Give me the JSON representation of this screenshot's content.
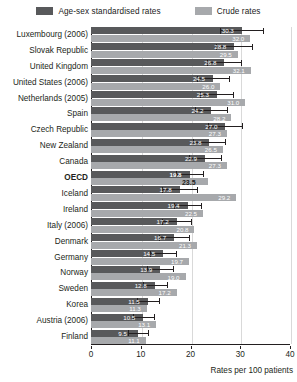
{
  "legend": {
    "items": [
      {
        "label": "Age-sex standardised rates",
        "color": "#58595b",
        "key": "standardised"
      },
      {
        "label": "Crude rates",
        "color": "#a7a9ac",
        "key": "crude"
      }
    ]
  },
  "axis": {
    "title": "Rates per 100 patients",
    "ticks": [
      "0",
      "10",
      "20",
      "30",
      "40"
    ],
    "min": 0,
    "max": 40
  },
  "colors": {
    "standardised": "#58595b",
    "crude": "#a7a9ac",
    "axis": "#231f20",
    "grid": "#d9d9d9"
  },
  "chart_data": {
    "type": "bar",
    "title": "",
    "subtitle": "",
    "xlabel": "Rates per 100 patients",
    "ylabel": "",
    "xlim": [
      0,
      40
    ],
    "grid": true,
    "orientation": "horizontal",
    "legend_position": "top",
    "categories": [
      "Luxembourg (2006)",
      "Slovak Republic",
      "United Kingdom",
      "United States (2006)",
      "Netherlands (2005)",
      "Spain",
      "Czech Republic",
      "New Zealand",
      "Canada",
      "OECD",
      "Iceland",
      "Ireland",
      "Italy (2006)",
      "Denmark",
      "Germany",
      "Norway",
      "Sweden",
      "Korea",
      "Austria (2006)",
      "Finland"
    ],
    "highlight_category": "OECD",
    "series": [
      {
        "name": "Age-sex standardised rates",
        "color": "#58595b",
        "values": [
          30.3,
          28.8,
          26.8,
          24.5,
          25.3,
          24.2,
          27.0,
          23.8,
          22.9,
          19.8,
          17.8,
          19.4,
          17.2,
          16.7,
          14.5,
          13.9,
          12.8,
          11.5,
          10.5,
          9.5
        ],
        "error_low": [
          26.0,
          25.2,
          23.4,
          21.3,
          22.0,
          21.0,
          23.6,
          20.6,
          19.7,
          17.0,
          14.2,
          16.6,
          14.3,
          13.7,
          11.9,
          11.3,
          10.4,
          9.3,
          8.4,
          7.5
        ],
        "error_high": [
          34.6,
          32.4,
          30.2,
          27.7,
          28.6,
          27.4,
          30.4,
          27.0,
          26.1,
          22.6,
          21.4,
          22.2,
          20.1,
          19.7,
          17.1,
          16.5,
          15.2,
          13.7,
          12.6,
          11.5
        ]
      },
      {
        "name": "Crude rates",
        "color": "#a7a9ac",
        "values": [
          32.0,
          29.5,
          32.1,
          26.0,
          31.0,
          28.2,
          27.3,
          26.5,
          27.3,
          23.5,
          29.2,
          22.5,
          20.8,
          21.3,
          19.7,
          19.0,
          17.2,
          11.3,
          13.1,
          11.1
        ]
      }
    ]
  }
}
